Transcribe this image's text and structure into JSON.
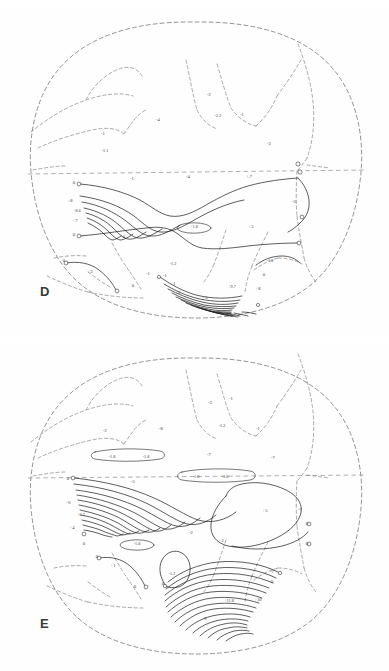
{
  "figure": {
    "title": "",
    "background_color": "#fefefe",
    "contour_color": "#1f1f1f",
    "outline_color": "#8d8d8d",
    "panel_count": 2
  },
  "panels": [
    {
      "id": "D",
      "letter": "D",
      "letter_position": "lower-left"
    },
    {
      "id": "E",
      "letter": "E",
      "letter_position": "lower-left"
    }
  ],
  "chart_data": [
    {
      "type": "contour",
      "title": "D",
      "projection": "globe",
      "grid": false,
      "legend": null,
      "xlabel": "",
      "ylabel": "",
      "features": [
        "dashed globe limb",
        "dashed continental outlines",
        "dashed equator",
        "solid isolines",
        "open circle terminators"
      ],
      "labels": [
        {
          "text": "-4",
          "x": 158,
          "y": 121
        },
        {
          "text": "-2",
          "x": 209,
          "y": 96
        },
        {
          "text": "-2.2",
          "x": 218,
          "y": 117
        },
        {
          "text": "-1",
          "x": 242,
          "y": 116
        },
        {
          "text": "-1",
          "x": 103,
          "y": 135
        },
        {
          "text": "-1.1",
          "x": 105,
          "y": 152
        },
        {
          "text": "-3",
          "x": 269,
          "y": 145
        },
        {
          "text": "-1",
          "x": 132,
          "y": 180
        },
        {
          "text": "-4",
          "x": 188,
          "y": 178
        },
        {
          "text": "+.7",
          "x": 249,
          "y": 178
        },
        {
          "text": "0",
          "x": 74,
          "y": 184
        },
        {
          "text": "+8",
          "x": 70,
          "y": 202
        },
        {
          "text": "+8.6",
          "x": 77,
          "y": 212
        },
        {
          "text": "+7",
          "x": 75,
          "y": 222
        },
        {
          "text": "0",
          "x": 74,
          "y": 236
        },
        {
          "text": "+1.8",
          "x": 194,
          "y": 228
        },
        {
          "text": "+5",
          "x": 251,
          "y": 228
        },
        {
          "text": "-3",
          "x": 294,
          "y": 203
        },
        {
          "text": "-4",
          "x": 123,
          "y": 238
        },
        {
          "text": "0",
          "x": 64,
          "y": 262
        },
        {
          "text": "+3",
          "x": 90,
          "y": 273
        },
        {
          "text": "0",
          "x": 133,
          "y": 287
        },
        {
          "text": "-1",
          "x": 148,
          "y": 275
        },
        {
          "text": "-1.2",
          "x": 173,
          "y": 265
        },
        {
          "text": "-1",
          "x": 165,
          "y": 277
        },
        {
          "text": "+1",
          "x": 173,
          "y": 285
        },
        {
          "text": "+2",
          "x": 178,
          "y": 294
        },
        {
          "text": "+5",
          "x": 205,
          "y": 299
        },
        {
          "text": "+9.7",
          "x": 232,
          "y": 288
        },
        {
          "text": "+8",
          "x": 258,
          "y": 290
        },
        {
          "text": "-1.8",
          "x": 270,
          "y": 262
        },
        {
          "text": "0",
          "x": 264,
          "y": 276
        }
      ]
    },
    {
      "type": "contour",
      "title": "E",
      "projection": "globe",
      "grid": false,
      "legend": null,
      "xlabel": "",
      "ylabel": "",
      "features": [
        "dashed globe limb",
        "dashed continental outlines",
        "dashed equator",
        "solid isolines",
        "elongated closed ovals",
        "open circle terminators"
      ],
      "labels": [
        {
          "text": "-3",
          "x": 210,
          "y": 404
        },
        {
          "text": "-1",
          "x": 231,
          "y": 400
        },
        {
          "text": "-2",
          "x": 105,
          "y": 432
        },
        {
          "text": "-8",
          "x": 161,
          "y": 430
        },
        {
          "text": "-1.2",
          "x": 222,
          "y": 427
        },
        {
          "text": "-1",
          "x": 258,
          "y": 430
        },
        {
          "text": "-1.8",
          "x": 112,
          "y": 458
        },
        {
          "text": "-1.8",
          "x": 146,
          "y": 458
        },
        {
          "text": "-7",
          "x": 209,
          "y": 456
        },
        {
          "text": "-7",
          "x": 273,
          "y": 459
        },
        {
          "text": "0",
          "x": 68,
          "y": 480
        },
        {
          "text": "-5",
          "x": 133,
          "y": 483
        },
        {
          "text": "-1.8",
          "x": 196,
          "y": 478
        },
        {
          "text": "-1.8",
          "x": 225,
          "y": 478
        },
        {
          "text": "+6",
          "x": 68,
          "y": 504
        },
        {
          "text": "+6.7",
          "x": 81,
          "y": 516
        },
        {
          "text": "+4",
          "x": 72,
          "y": 529
        },
        {
          "text": "0",
          "x": 84,
          "y": 545
        },
        {
          "text": "-1.8",
          "x": 137,
          "y": 545
        },
        {
          "text": "-2",
          "x": 191,
          "y": 534
        },
        {
          "text": "+3",
          "x": 221,
          "y": 542
        },
        {
          "text": "+5",
          "x": 265,
          "y": 512
        },
        {
          "text": "-7",
          "x": 300,
          "y": 511
        },
        {
          "text": "0",
          "x": 307,
          "y": 525
        },
        {
          "text": "0",
          "x": 307,
          "y": 545
        },
        {
          "text": "0",
          "x": 97,
          "y": 558
        },
        {
          "text": "+1",
          "x": 113,
          "y": 567
        },
        {
          "text": "0",
          "x": 135,
          "y": 588
        },
        {
          "text": "-1.2",
          "x": 172,
          "y": 575
        },
        {
          "text": "0",
          "x": 163,
          "y": 585
        },
        {
          "text": "+11.8",
          "x": 229,
          "y": 602
        },
        {
          "text": "+10",
          "x": 258,
          "y": 601
        },
        {
          "text": "+9",
          "x": 204,
          "y": 620
        },
        {
          "text": "-7",
          "x": 272,
          "y": 573
        },
        {
          "text": "0",
          "x": 272,
          "y": 583
        }
      ]
    }
  ]
}
